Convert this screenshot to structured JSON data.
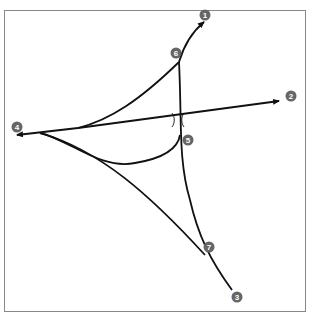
{
  "diagram": {
    "type": "road-interchange-schematic",
    "frame": {
      "x": 4,
      "y": 10,
      "width": 302,
      "height": 302,
      "stroke": "#888888"
    },
    "line_color": "#111111",
    "badge_color": "#666666",
    "markers": [
      {
        "id": "1",
        "label": "1",
        "x": 205,
        "y": 15
      },
      {
        "id": "2",
        "label": "2",
        "x": 291,
        "y": 96
      },
      {
        "id": "3",
        "label": "3",
        "x": 237,
        "y": 297
      },
      {
        "id": "4",
        "label": "4",
        "x": 17,
        "y": 127
      },
      {
        "id": "5",
        "label": "5",
        "x": 188,
        "y": 140
      },
      {
        "id": "6",
        "label": "6",
        "x": 176,
        "y": 53
      },
      {
        "id": "7",
        "label": "7",
        "x": 209,
        "y": 247
      }
    ],
    "bridge_symbol": {
      "x": 178,
      "y": 120
    }
  }
}
